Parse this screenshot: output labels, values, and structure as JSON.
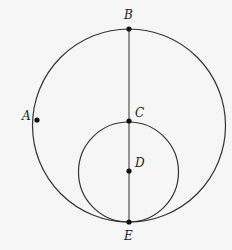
{
  "diagram": {
    "type": "geometry",
    "colors": {
      "background": "#f6f6f6",
      "stroke": "#333333",
      "point": "#111111"
    },
    "large_circle": {
      "cx": 129,
      "cy": 125.5,
      "r": 96.5
    },
    "small_circle": {
      "cx": 128.5,
      "cy": 172,
      "r": 50
    },
    "segment": {
      "from": "B",
      "to": "E"
    },
    "points": [
      {
        "id": "B",
        "label": "B",
        "x": 129,
        "y": 29,
        "label_x": 124,
        "label_y": 19
      },
      {
        "id": "A",
        "label": "A",
        "x": 37,
        "y": 120,
        "label_x": 22,
        "label_y": 120
      },
      {
        "id": "C",
        "label": "C",
        "x": 129,
        "y": 121,
        "label_x": 135,
        "label_y": 117
      },
      {
        "id": "D",
        "label": "D",
        "x": 129,
        "y": 171,
        "label_x": 135,
        "label_y": 167
      },
      {
        "id": "E",
        "label": "E",
        "x": 129,
        "y": 222,
        "label_x": 124,
        "label_y": 240
      }
    ]
  }
}
